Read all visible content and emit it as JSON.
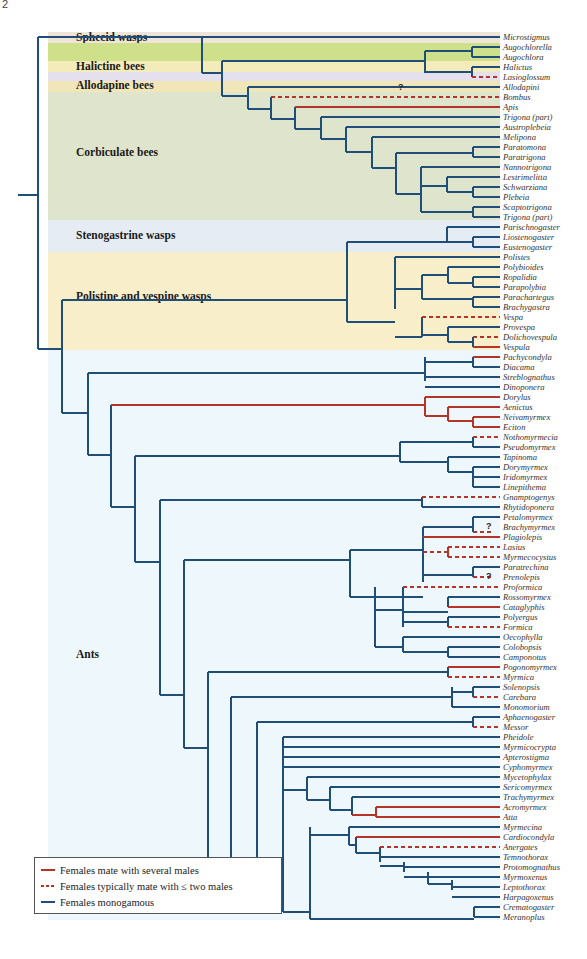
{
  "page_number": "2",
  "colors": {
    "monogamous": "#1f4e79",
    "several_males": "#b5342a",
    "two_males": "#b5342a"
  },
  "groups": [
    {
      "label": "Sphecid wasps",
      "top": 32,
      "height": 11,
      "color": "#efe4d6",
      "label_y": 33
    },
    {
      "label": "",
      "top": 43,
      "height": 18,
      "color": "#cfe08a",
      "label_y": 0
    },
    {
      "label": "Halictine bees",
      "top": 61,
      "height": 11,
      "color": "#f3ecba",
      "label_y": 62
    },
    {
      "label": "",
      "top": 72,
      "height": 9,
      "color": "#e4e0ee",
      "label_y": 0
    },
    {
      "label": "Allodapine bees",
      "top": 81,
      "height": 11,
      "color": "#f1e6b8",
      "label_y": 81
    },
    {
      "label": "Corbiculate bees",
      "top": 92,
      "height": 128,
      "color": "#dfe4cc",
      "label_y": 148
    },
    {
      "label": "Stenogastrine wasps",
      "top": 220,
      "height": 32,
      "color": "#e6ecf4",
      "label_y": 231
    },
    {
      "label": "Polistine and vespine wasps",
      "top": 252,
      "height": 98,
      "color": "#f8efca",
      "label_y": 292
    },
    {
      "label": "Ants",
      "top": 350,
      "height": 570,
      "color": "#eef7fb",
      "label_y": 650
    }
  ],
  "taxa": [
    {
      "name": "Microstigmus",
      "y": 37
    },
    {
      "name": "Augochlorella",
      "y": 47
    },
    {
      "name": "Augochlora",
      "y": 57
    },
    {
      "name": "Halictus",
      "y": 67
    },
    {
      "name": "Lasioglossum",
      "y": 77
    },
    {
      "name": "Allodapini",
      "y": 87
    },
    {
      "name": "Bombus",
      "y": 97
    },
    {
      "name": "Apis",
      "y": 107
    },
    {
      "name": "Trigona (part)",
      "y": 117
    },
    {
      "name": "Austroplebeia",
      "y": 127
    },
    {
      "name": "Melipona",
      "y": 137
    },
    {
      "name": "Paratomona",
      "y": 147
    },
    {
      "name": "Paratrigona",
      "y": 157
    },
    {
      "name": "Nannotrigona",
      "y": 167
    },
    {
      "name": "Lestrimelitta",
      "y": 177
    },
    {
      "name": "Schwarziana",
      "y": 187
    },
    {
      "name": "Plebeia",
      "y": 197
    },
    {
      "name": "Scaptotrigona",
      "y": 207
    },
    {
      "name": "Trigona (part)",
      "y": 217
    },
    {
      "name": "Parischnogaster",
      "y": 227
    },
    {
      "name": "Liostenogaster",
      "y": 237
    },
    {
      "name": "Eustenogaster",
      "y": 247
    },
    {
      "name": "Polistes",
      "y": 257
    },
    {
      "name": "Polybioides",
      "y": 267
    },
    {
      "name": "Ropalidia",
      "y": 277
    },
    {
      "name": "Parapolybia",
      "y": 287
    },
    {
      "name": "Parachartegus",
      "y": 297
    },
    {
      "name": "Brachygastra",
      "y": 307
    },
    {
      "name": "Vespa",
      "y": 317
    },
    {
      "name": "Provespa",
      "y": 327
    },
    {
      "name": "Dolichovespula",
      "y": 337
    },
    {
      "name": "Vespula",
      "y": 347
    },
    {
      "name": "Pachycondyla",
      "y": 357
    },
    {
      "name": "Diacama",
      "y": 367
    },
    {
      "name": "Streblognathus",
      "y": 377
    },
    {
      "name": "Dinoponera",
      "y": 387
    },
    {
      "name": "Dorylus",
      "y": 397
    },
    {
      "name": "Aenictus",
      "y": 407
    },
    {
      "name": "Neivamyrmex",
      "y": 417
    },
    {
      "name": "Eciton",
      "y": 427
    },
    {
      "name": "Nothomyrmecia",
      "y": 437
    },
    {
      "name": "Pseudomyrmex",
      "y": 447
    },
    {
      "name": "Tapinoma",
      "y": 457
    },
    {
      "name": "Dorymyrmex",
      "y": 467
    },
    {
      "name": "Iridomyrmex",
      "y": 477
    },
    {
      "name": "Linepithema",
      "y": 487
    },
    {
      "name": "Gnamptogenys",
      "y": 497
    },
    {
      "name": "Rhytidoponera",
      "y": 507
    },
    {
      "name": "Petalomyrmex",
      "y": 517
    },
    {
      "name": "Brachymyrmex",
      "y": 527
    },
    {
      "name": "Plagiolepis",
      "y": 537
    },
    {
      "name": "Lasius",
      "y": 547
    },
    {
      "name": "Myrmecocystus",
      "y": 557
    },
    {
      "name": "Paratrechina",
      "y": 567
    },
    {
      "name": "Prenolepis",
      "y": 577
    },
    {
      "name": "Proformica",
      "y": 587
    },
    {
      "name": "Rossomyrmex",
      "y": 597
    },
    {
      "name": "Cataglyphis",
      "y": 607
    },
    {
      "name": "Polyergus",
      "y": 617
    },
    {
      "name": "Formica",
      "y": 627
    },
    {
      "name": "Oecophylla",
      "y": 637
    },
    {
      "name": "Colobopsis",
      "y": 647
    },
    {
      "name": "Camponotus",
      "y": 657
    },
    {
      "name": "Pogonomyrmex",
      "y": 667
    },
    {
      "name": "Myrmica",
      "y": 677
    },
    {
      "name": "Solenopsis",
      "y": 687
    },
    {
      "name": "Carebara",
      "y": 697
    },
    {
      "name": "Monomorium",
      "y": 707
    },
    {
      "name": "Aphaenogaster",
      "y": 717
    },
    {
      "name": "Messor",
      "y": 727
    },
    {
      "name": "Pheidole",
      "y": 737
    },
    {
      "name": "Myrmicocrypta",
      "y": 747
    },
    {
      "name": "Apterostigma",
      "y": 757
    },
    {
      "name": "Cyphomyrmex",
      "y": 767
    },
    {
      "name": "Mycetophylax",
      "y": 777
    },
    {
      "name": "Sericomyrmex",
      "y": 787
    },
    {
      "name": "Trachymyrmex",
      "y": 797
    },
    {
      "name": "Acromyrmex",
      "y": 807
    },
    {
      "name": "Atta",
      "y": 817
    },
    {
      "name": "Myrmecina",
      "y": 827
    },
    {
      "name": "Cardiocondyla",
      "y": 837
    },
    {
      "name": "Anergates",
      "y": 847
    },
    {
      "name": "Temnothorax",
      "y": 857
    },
    {
      "name": "Protomognathus",
      "y": 867
    },
    {
      "name": "Myrmoxenus",
      "y": 877
    },
    {
      "name": "Leptothorax",
      "y": 887
    },
    {
      "name": "Harpagoxenus",
      "y": 897
    },
    {
      "name": "Crematogaster",
      "y": 907
    },
    {
      "name": "Meranoplus",
      "y": 917
    }
  ],
  "question_marks": [
    {
      "text": "?",
      "x": 398,
      "y": 83
    },
    {
      "text": "?",
      "x": 486,
      "y": 522
    },
    {
      "text": "?",
      "x": 486,
      "y": 572
    }
  ],
  "legend": {
    "items": [
      {
        "label": "Females mate with several males",
        "style": "solid-red"
      },
      {
        "label": "Females typically mate with ≤ two males",
        "style": "dashed-red"
      },
      {
        "label": "Females monogamous",
        "style": "solid-blue"
      }
    ]
  }
}
